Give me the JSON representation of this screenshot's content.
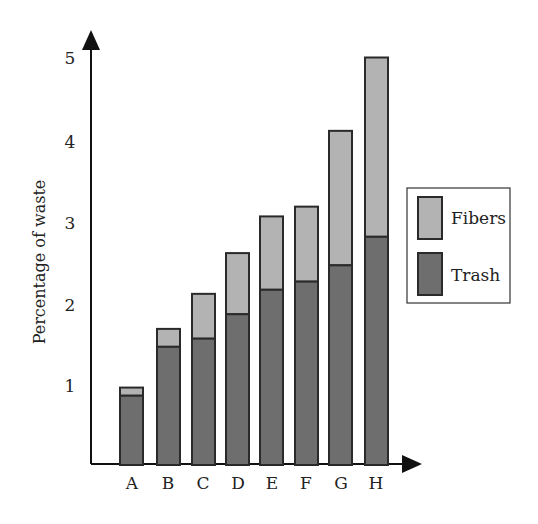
{
  "chart_data": {
    "type": "bar",
    "stacked": true,
    "title": "",
    "xlabel": "",
    "ylabel": "Percentage of waste",
    "categories": [
      "A",
      "B",
      "C",
      "D",
      "E",
      "F",
      "G",
      "H"
    ],
    "series": [
      {
        "name": "Trash",
        "color": "#6e6e6e",
        "values": [
          0.85,
          1.45,
          1.55,
          1.85,
          2.15,
          2.25,
          2.45,
          2.8
        ]
      },
      {
        "name": "Fibers",
        "color": "#b3b3b3",
        "values": [
          0.1,
          0.22,
          0.55,
          0.75,
          0.9,
          0.92,
          1.65,
          2.2
        ]
      }
    ],
    "totals": [
      0.95,
      1.67,
      2.1,
      2.6,
      3.05,
      3.17,
      4.1,
      5.0
    ],
    "yticks": [
      1,
      2,
      3,
      4,
      5
    ],
    "ylim": [
      0,
      5.2
    ],
    "grid": false,
    "legend": {
      "position": "right",
      "entries": [
        "Fibers",
        "Trash"
      ]
    }
  },
  "axes": {
    "y_title": "Percentage of waste",
    "y_ticks": [
      "1",
      "2",
      "3",
      "4",
      "5"
    ],
    "x_ticks": [
      "A",
      "B",
      "C",
      "D",
      "E",
      "F",
      "G",
      "H"
    ]
  },
  "legend": {
    "items": [
      {
        "label": "Fibers",
        "color": "#b3b3b3"
      },
      {
        "label": "Trash",
        "color": "#6e6e6e"
      }
    ]
  },
  "colors": {
    "fibers": "#b3b3b3",
    "trash": "#6e6e6e",
    "outline": "#2a2a2a",
    "axis": "#111111"
  }
}
